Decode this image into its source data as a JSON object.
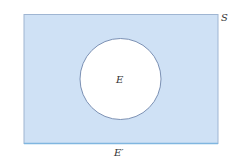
{
  "diagram": {
    "type": "venn",
    "sample_space": {
      "label": "S",
      "fill": "#cfe1f5",
      "stroke": "#8fa8c8",
      "bottom_stroke": "#7fb6e0"
    },
    "event": {
      "label": "E",
      "fill": "#ffffff",
      "stroke": "#6f86ab"
    },
    "complement": {
      "label": "E′"
    }
  }
}
